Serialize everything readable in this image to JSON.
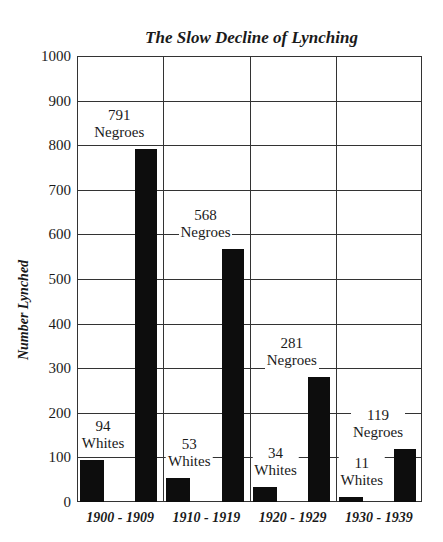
{
  "chart_data": {
    "type": "bar",
    "title": "The Slow Decline of Lynching",
    "xlabel": "",
    "ylabel": "Number Lynched",
    "ylim": [
      0,
      1000
    ],
    "yticks": [
      0,
      100,
      200,
      300,
      400,
      500,
      600,
      700,
      800,
      900,
      1000
    ],
    "grid": true,
    "categories": [
      "1900 - 1909",
      "1910 - 1919",
      "1920 - 1929",
      "1930 - 1939"
    ],
    "series": [
      {
        "name": "Whites",
        "values": [
          94,
          53,
          34,
          11
        ]
      },
      {
        "name": "Negroes",
        "values": [
          791,
          568,
          281,
          119
        ]
      }
    ],
    "annotations": [
      {
        "category": "1900 - 1909",
        "series": "Whites",
        "number": "94",
        "text": "Whites"
      },
      {
        "category": "1900 - 1909",
        "series": "Negroes",
        "number": "791",
        "text": "Negroes"
      },
      {
        "category": "1910 - 1919",
        "series": "Whites",
        "number": "53",
        "text": "Whites"
      },
      {
        "category": "1910 - 1919",
        "series": "Negroes",
        "number": "568",
        "text": "Negroes"
      },
      {
        "category": "1920 - 1929",
        "series": "Whites",
        "number": "34",
        "text": "Whites"
      },
      {
        "category": "1920 - 1929",
        "series": "Negroes",
        "number": "281",
        "text": "Negroes"
      },
      {
        "category": "1930 - 1939",
        "series": "Whites",
        "number": "11",
        "text": "Whites"
      },
      {
        "category": "1930 - 1939",
        "series": "Negroes",
        "number": "119",
        "text": "Negroes"
      }
    ],
    "bar_color": "#0d0d0d"
  }
}
